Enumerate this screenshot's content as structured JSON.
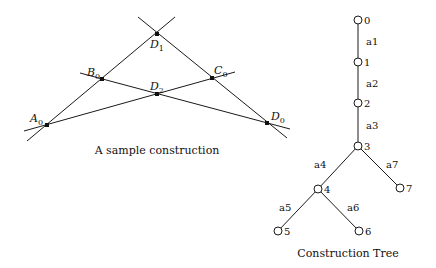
{
  "construction": {
    "caption": "A sample construction",
    "points": [
      {
        "id": "A0",
        "base": "A",
        "sub": "0",
        "x": 47,
        "y": 125,
        "lx": 30,
        "ly": 122
      },
      {
        "id": "B0",
        "base": "B",
        "sub": "0",
        "x": 102,
        "y": 79,
        "lx": 87,
        "ly": 76
      },
      {
        "id": "C0",
        "base": "C",
        "sub": "0",
        "x": 212,
        "y": 78,
        "lx": 214,
        "ly": 74
      },
      {
        "id": "D0",
        "base": "D",
        "sub": "0",
        "x": 267,
        "y": 123,
        "lx": 271,
        "ly": 120
      },
      {
        "id": "D1",
        "base": "D",
        "sub": "1",
        "x": 157,
        "y": 34,
        "lx": 150,
        "ly": 48
      },
      {
        "id": "D2",
        "base": "D",
        "sub": "2",
        "x": 157,
        "y": 94,
        "lx": 150,
        "ly": 90
      }
    ],
    "lines": [
      {
        "from": "A0-D1",
        "x1": 27,
        "y1": 141,
        "x2": 175,
        "y2": 17
      },
      {
        "from": "B0-D0",
        "x1": 80,
        "y1": 73,
        "x2": 290,
        "y2": 129
      },
      {
        "from": "A0-C0",
        "x1": 24,
        "y1": 131,
        "x2": 235,
        "y2": 72
      },
      {
        "from": "D1-D0",
        "x1": 138,
        "y1": 17,
        "x2": 287,
        "y2": 138
      }
    ]
  },
  "tree": {
    "caption": "Construction Tree",
    "nodes": [
      {
        "id": "0",
        "label": "0",
        "x": 358,
        "y": 20
      },
      {
        "id": "1",
        "label": "1",
        "x": 358,
        "y": 62
      },
      {
        "id": "2",
        "label": "2",
        "x": 358,
        "y": 103
      },
      {
        "id": "3",
        "label": "3",
        "x": 358,
        "y": 146
      },
      {
        "id": "4",
        "label": "4",
        "x": 318,
        "y": 189
      },
      {
        "id": "5",
        "label": "5",
        "x": 278,
        "y": 231
      },
      {
        "id": "6",
        "label": "6",
        "x": 359,
        "y": 231
      },
      {
        "id": "7",
        "label": "7",
        "x": 400,
        "y": 188
      }
    ],
    "edges": [
      {
        "label": "a1",
        "from": "0",
        "to": "1",
        "lx": 366,
        "ly": 45
      },
      {
        "label": "a2",
        "from": "1",
        "to": "2",
        "lx": 366,
        "ly": 87
      },
      {
        "label": "a3",
        "from": "2",
        "to": "3",
        "lx": 366,
        "ly": 129
      },
      {
        "label": "a4",
        "from": "3",
        "to": "4",
        "lx": 314,
        "ly": 168
      },
      {
        "label": "a5",
        "from": "4",
        "to": "5",
        "lx": 279,
        "ly": 211
      },
      {
        "label": "a6",
        "from": "4",
        "to": "6",
        "lx": 347,
        "ly": 211
      },
      {
        "label": "a7",
        "from": "3",
        "to": "7",
        "lx": 386,
        "ly": 168
      }
    ]
  }
}
